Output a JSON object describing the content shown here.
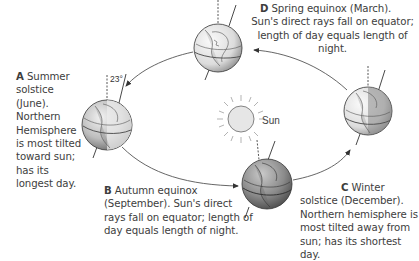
{
  "diagram": {
    "type": "earth-orbit-seasons",
    "sun": {
      "label": "Sun"
    },
    "tilt_angle_label": "23°",
    "positions": [
      {
        "id": "A",
        "letter": "A",
        "title": "Summer solstice (June).",
        "text_line1": "Summer",
        "text_rest": "solstice (June). Northern Hemisphere is most tilted toward sun; has its longest day."
      },
      {
        "id": "B",
        "letter": "B",
        "title": "Autumn equinox (September).",
        "text_line1": "Autumn equinox",
        "text_rest": "(September). Sun's direct rays fall on equator; length of day equals length of night."
      },
      {
        "id": "C",
        "letter": "C",
        "title": "Winter solstice (December).",
        "text_line1": "Winter",
        "text_rest": "solstice (December). Northern hemisphere is most tilted away from sun; has its shortest day."
      },
      {
        "id": "D",
        "letter": "D",
        "title": "Spring equinox (March).",
        "text_line1": "Spring equinox (March).",
        "text_rest": "Sun's direct rays fall on equator; length of day equals length of night."
      }
    ],
    "orbit_direction": "counterclockwise (A → B → C → D → A)"
  }
}
